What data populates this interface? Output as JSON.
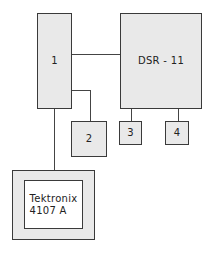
{
  "diagram": {
    "nodes": {
      "n1": {
        "label": "1"
      },
      "dsr": {
        "label": "DSR - 11"
      },
      "n2": {
        "label": "2"
      },
      "n3": {
        "label": "3"
      },
      "n4": {
        "label": "4"
      },
      "terminal": {
        "label": "Tektronix\n4107 A"
      }
    },
    "edges": [
      {
        "from": "1",
        "to": "DSR - 11"
      },
      {
        "from": "1",
        "to": "2"
      },
      {
        "from": "DSR - 11",
        "to": "3"
      },
      {
        "from": "DSR - 11",
        "to": "4"
      },
      {
        "from": "1",
        "to": "Tektronix 4107 A"
      }
    ],
    "colors": {
      "fill": "#e9e9e9",
      "stroke": "#3a3a3a",
      "screen": "#ffffff"
    }
  }
}
